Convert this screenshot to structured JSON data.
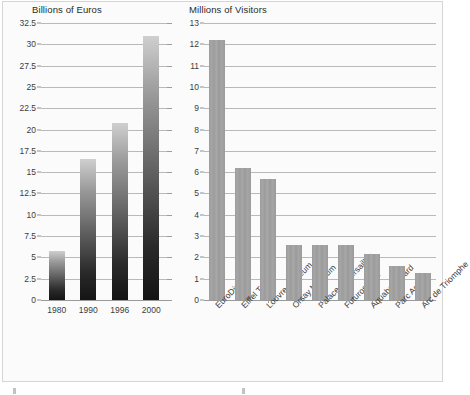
{
  "figure": {
    "background_color": "#fbfbfb",
    "border_color": "#d6d6d6",
    "bar_gradient_dark": "#141414",
    "bar_gradient_light": "#cfcfcf",
    "bar_solid_color": "#9e9e9e",
    "gridline_color": "#b9b9b9",
    "text_color": "#3b3b3b"
  },
  "chart_data": [
    {
      "type": "bar",
      "id": "tourism-revenue",
      "title": "",
      "ylabel": "Billions of Euros",
      "xlabel": "",
      "categories": [
        "1980",
        "1990",
        "1996",
        "2000"
      ],
      "values": [
        5.7,
        16.6,
        20.8,
        31.0
      ],
      "yticks": [
        "0",
        "2.5",
        "5",
        "7.5",
        "10",
        "12.5",
        "15",
        "17.5",
        "20",
        "22.5",
        "25",
        "27.5",
        "30",
        "32.5"
      ],
      "ytick_values": [
        0,
        2.5,
        5,
        7.5,
        10,
        12.5,
        15,
        17.5,
        20,
        22.5,
        25,
        27.5,
        30,
        32.5
      ],
      "ylim": [
        0,
        32.5
      ],
      "grid": true,
      "legend": "none",
      "bar_style": "vertical-gradient"
    },
    {
      "type": "bar",
      "id": "attraction-visitors",
      "title": "",
      "ylabel": "Millions of Visitors",
      "xlabel": "",
      "categories": [
        "EuroDisney",
        "Eiffel Tower",
        "Louvre Museum",
        "Orsay Museum",
        "Palace of Versailles",
        "Futuroscope",
        "Aquaboulevard",
        "Parc Asterix",
        "Arc de Triomphe"
      ],
      "values": [
        12.2,
        6.2,
        5.7,
        2.6,
        2.6,
        2.6,
        2.15,
        1.6,
        1.25
      ],
      "yticks": [
        "0",
        "1",
        "2",
        "3",
        "4",
        "5",
        "6",
        "7",
        "8",
        "9",
        "10",
        "11",
        "12",
        "13"
      ],
      "ytick_values": [
        0,
        1,
        2,
        3,
        4,
        5,
        6,
        7,
        8,
        9,
        10,
        11,
        12,
        13
      ],
      "ylim": [
        0,
        13
      ],
      "grid": true,
      "legend": "none",
      "bar_style": "solid-gray"
    }
  ]
}
